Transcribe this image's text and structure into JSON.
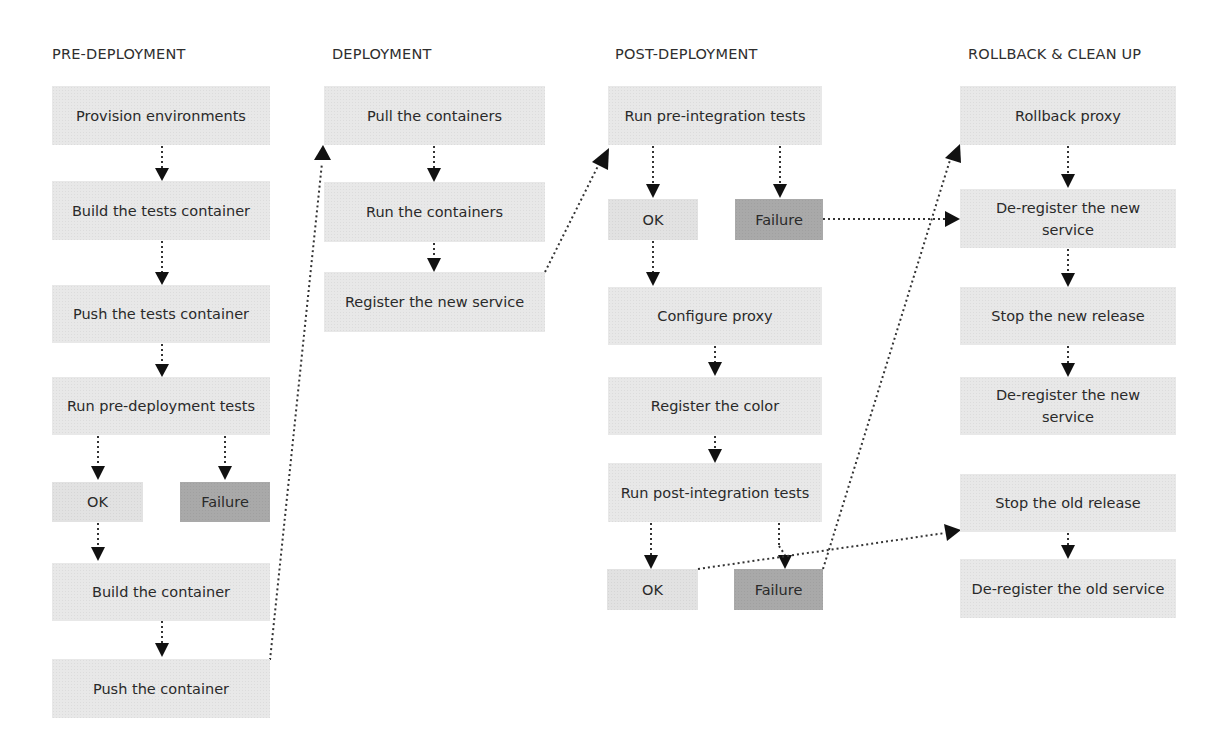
{
  "columns": [
    {
      "title": "PRE-DEPLOYMENT",
      "steps": {
        "provision": "Provision environments",
        "build_tests": "Build the tests container",
        "push_tests": "Push the tests container",
        "run_pre_deploy": "Run pre-deployment tests",
        "ok": "OK",
        "failure": "Failure",
        "build_container": "Build the container",
        "push_container": "Push the container"
      }
    },
    {
      "title": "DEPLOYMENT",
      "steps": {
        "pull": "Pull the containers",
        "run": "Run the containers",
        "register": "Register the new service"
      }
    },
    {
      "title": "POST-DEPLOYMENT",
      "steps": {
        "run_pre_int": "Run pre-integration tests",
        "ok1": "OK",
        "failure1": "Failure",
        "configure_proxy": "Configure proxy",
        "register_color": "Register the color",
        "run_post_int": "Run post-integration tests",
        "ok2": "OK",
        "failure2": "Failure"
      }
    },
    {
      "title": "ROLLBACK & CLEAN UP",
      "steps": {
        "rollback_proxy": "Rollback proxy",
        "deregister_new_1": "De-register the new service",
        "stop_new": "Stop the new release",
        "deregister_new_2": "De-register the new service",
        "stop_old": "Stop the old release",
        "deregister_old": "De-register the old service"
      }
    }
  ],
  "colors": {
    "box": "#e8e8e8",
    "ok_box": "#e2e2e2",
    "failure_box": "#a9a9a9",
    "arrow": "#111111",
    "text": "#2a2a2a"
  }
}
